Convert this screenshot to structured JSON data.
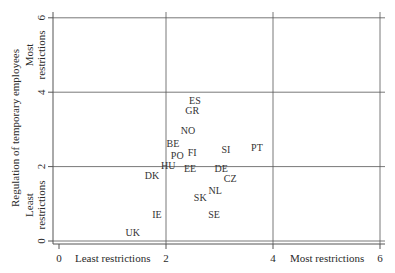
{
  "chart_data": {
    "type": "scatter",
    "title": "",
    "xlabel": "",
    "ylabel": "Regulation of temporary employees",
    "x_annotations": {
      "low": "Least restrictions",
      "high": "Most restrictions"
    },
    "y_annotations": {
      "low": [
        "Least",
        "restrictions"
      ],
      "high": [
        "Most",
        "restrictions"
      ]
    },
    "xlim": [
      0,
      6
    ],
    "ylim": [
      0,
      6
    ],
    "x_ticks": [
      0,
      2,
      4,
      6
    ],
    "y_ticks": [
      0,
      2,
      4,
      6
    ],
    "grid": true,
    "points": [
      {
        "label": "ES",
        "x": 2.54,
        "y": 3.79
      },
      {
        "label": "GR",
        "x": 2.49,
        "y": 3.52
      },
      {
        "label": "NO",
        "x": 2.41,
        "y": 2.98
      },
      {
        "label": "BE",
        "x": 2.13,
        "y": 2.63
      },
      {
        "label": "PO",
        "x": 2.21,
        "y": 2.31
      },
      {
        "label": "FI",
        "x": 2.49,
        "y": 2.37
      },
      {
        "label": "SI",
        "x": 3.12,
        "y": 2.47
      },
      {
        "label": "PT",
        "x": 3.7,
        "y": 2.52
      },
      {
        "label": "HU",
        "x": 2.04,
        "y": 2.02
      },
      {
        "label": "DK",
        "x": 1.74,
        "y": 1.75
      },
      {
        "label": "EE",
        "x": 2.45,
        "y": 1.94
      },
      {
        "label": "DE",
        "x": 3.03,
        "y": 1.94
      },
      {
        "label": "CZ",
        "x": 3.2,
        "y": 1.67
      },
      {
        "label": "NL",
        "x": 2.92,
        "y": 1.37
      },
      {
        "label": "SK",
        "x": 2.64,
        "y": 1.16
      },
      {
        "label": "SE",
        "x": 2.9,
        "y": 0.7
      },
      {
        "label": "IE",
        "x": 1.83,
        "y": 0.7
      },
      {
        "label": "UK",
        "x": 1.38,
        "y": 0.24
      }
    ]
  }
}
